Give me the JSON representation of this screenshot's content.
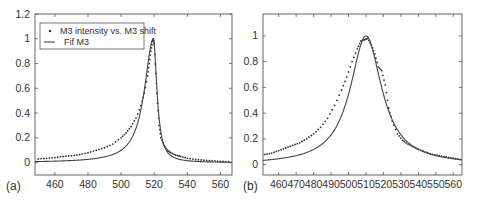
{
  "chart_data": [
    {
      "panel_label": "(a)",
      "type": "line",
      "title": "",
      "xlabel": "",
      "ylabel": "",
      "xlim": [
        448,
        567
      ],
      "ylim": [
        -0.1,
        1.2
      ],
      "xticks": [
        460,
        480,
        500,
        520,
        540,
        560
      ],
      "yticks": [
        0,
        0.2,
        0.4,
        0.6,
        0.8,
        1,
        1.2
      ],
      "ytick_labels": [
        "0",
        "0.2",
        "0.4",
        "0.6",
        "0.8",
        "1",
        "1.2"
      ],
      "grid": false,
      "legend": {
        "position": "upper left",
        "entries": [
          {
            "label": "M3 intensity vs. M3 shift",
            "style": "markers"
          },
          {
            "label": "Fif M3",
            "style": "line"
          }
        ]
      },
      "series": [
        {
          "name": "M3 intensity vs. M3 shift",
          "style": "markers",
          "x": [
            450,
            455,
            460,
            465,
            470,
            475,
            480,
            485,
            490,
            495,
            500,
            503,
            506,
            509,
            512,
            514,
            516,
            517,
            518,
            519,
            519.5,
            520,
            521,
            522,
            523,
            524,
            526,
            528,
            530,
            533,
            536,
            540,
            545,
            550,
            555,
            560,
            565
          ],
          "y": [
            0.03,
            0.035,
            0.04,
            0.05,
            0.055,
            0.065,
            0.08,
            0.1,
            0.12,
            0.15,
            0.2,
            0.24,
            0.29,
            0.36,
            0.46,
            0.56,
            0.7,
            0.8,
            0.9,
            0.98,
            1.0,
            0.95,
            0.72,
            0.48,
            0.3,
            0.2,
            0.14,
            0.1,
            0.08,
            0.06,
            0.05,
            0.035,
            0.025,
            0.02,
            0.015,
            0.01,
            0.008
          ]
        },
        {
          "name": "Fif M3",
          "style": "line",
          "model": "fano",
          "params": {
            "x0": 519.5,
            "gamma_left": 6.5,
            "gamma_right": 2.6,
            "amplitude": 1.0,
            "baseline": 0.0
          }
        }
      ]
    },
    {
      "panel_label": "(b)",
      "type": "line",
      "title": "",
      "xlabel": "",
      "ylabel": "",
      "xlim": [
        451,
        565
      ],
      "ylim": [
        -0.08,
        1.17
      ],
      "xticks": [
        460,
        470,
        480,
        490,
        500,
        510,
        520,
        530,
        540,
        550,
        560
      ],
      "yticks": [
        0,
        0.2,
        0.4,
        0.6,
        0.8,
        1
      ],
      "ytick_labels": [
        "0",
        "0.2",
        "0.4",
        "0.6",
        "0.8",
        "1"
      ],
      "grid": false,
      "series": [
        {
          "name": "data",
          "style": "markers",
          "x": [
            452,
            456,
            460,
            464,
            468,
            472,
            476,
            480,
            484,
            488,
            492,
            496,
            499,
            502,
            505,
            507,
            509,
            511,
            513,
            515,
            517,
            519,
            521,
            523,
            525,
            528,
            531,
            534,
            537,
            540,
            544,
            548,
            552,
            556,
            560,
            564
          ],
          "y": [
            0.08,
            0.09,
            0.11,
            0.13,
            0.15,
            0.17,
            0.2,
            0.24,
            0.29,
            0.36,
            0.46,
            0.58,
            0.68,
            0.8,
            0.9,
            0.96,
            0.97,
            0.98,
            0.93,
            0.86,
            0.76,
            0.73,
            0.62,
            0.44,
            0.34,
            0.24,
            0.19,
            0.16,
            0.14,
            0.12,
            0.1,
            0.08,
            0.07,
            0.06,
            0.05,
            0.04
          ]
        },
        {
          "name": "fit",
          "style": "line",
          "model": "lorentzian",
          "params": {
            "x0": 510,
            "gamma": 11,
            "amplitude": 1.0,
            "baseline": 0.0
          }
        }
      ]
    }
  ]
}
